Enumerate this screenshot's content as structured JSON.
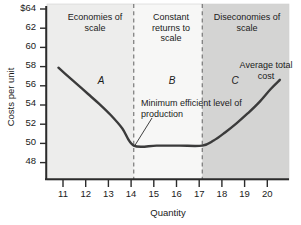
{
  "chart_data": {
    "type": "line",
    "title": "",
    "xlabel": "Quantity",
    "ylabel": "Costs per unit",
    "xlim": [
      10.2,
      20.8
    ],
    "ylim": [
      46.6,
      64
    ],
    "grid": false,
    "legend": "none",
    "x_ticks": [
      "11",
      "12",
      "13",
      "14",
      "15",
      "16",
      "17",
      "18",
      "19",
      "20"
    ],
    "x_tick_values": [
      11,
      12,
      13,
      14,
      15,
      16,
      17,
      18,
      19,
      20
    ],
    "y_ticks": [
      "$64",
      "62",
      "60",
      "58",
      "56",
      "54",
      "52",
      "50",
      "48"
    ],
    "y_tick_values": [
      64,
      62,
      60,
      58,
      56,
      54,
      52,
      50,
      48
    ],
    "series": [
      {
        "name": "Average total cost",
        "x": [
          10.7,
          11.0,
          11.5,
          12.0,
          12.5,
          13.0,
          13.5,
          14.0,
          15.0,
          16.0,
          17.0,
          17.5,
          18.0,
          18.5,
          19.0,
          19.5,
          20.0,
          20.4
        ],
        "values": [
          57.7,
          57.1,
          56.1,
          55.1,
          54.1,
          53.0,
          51.7,
          50.0,
          50.0,
          50.0,
          50.0,
          50.5,
          51.3,
          52.2,
          53.2,
          54.3,
          55.6,
          56.5
        ]
      }
    ],
    "annotations": [
      {
        "name": "minimum-efficient-scale",
        "text": "Minimum efficient level of production",
        "x": 14,
        "y": 50
      },
      {
        "name": "curve-label",
        "text": "Average total cost",
        "x": 20,
        "y": 56.5
      },
      {
        "name": "segment-a",
        "text": "A",
        "x": 12.2,
        "y": 56.8
      },
      {
        "name": "segment-b",
        "text": "B",
        "x": 15.4,
        "y": 56.8
      },
      {
        "name": "segment-c",
        "text": "C",
        "x": 18.2,
        "y": 56.8
      }
    ],
    "regions": [
      {
        "name": "economies-of-scale",
        "label": "Economies of scale",
        "x_start": 10.2,
        "x_end": 14,
        "fill": "#ededec"
      },
      {
        "name": "constant-returns-to-scale",
        "label": "Constant returns to scale",
        "x_start": 14,
        "x_end": 17,
        "fill": "#f7f7f6"
      },
      {
        "name": "diseconomies-of-scale",
        "label": "Diseconomies of scale",
        "x_start": 17,
        "x_end": 20.8,
        "fill": "#d4d4d3"
      }
    ],
    "dividers": [
      {
        "name": "divider-14",
        "x": 14
      },
      {
        "name": "divider-17",
        "x": 17
      }
    ]
  },
  "colors": {
    "curve": "#3b3b3b",
    "axis": "#2b2b2b",
    "text": "#1a1a1a",
    "region_light": "#ededec",
    "region_white": "#f7f7f6",
    "region_dark": "#d4d4d3",
    "divider": "#6e6e6e"
  }
}
